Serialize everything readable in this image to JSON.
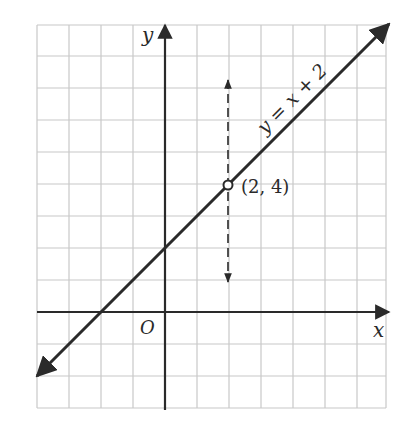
{
  "diagram": {
    "type": "coordinate-graph",
    "grid": {
      "x_min": -4,
      "x_max": 7,
      "y_min": -3,
      "y_max": 9,
      "cell_px": 32,
      "color": "#c8c8c8"
    },
    "axes": {
      "x_label": "x",
      "y_label": "y",
      "origin_label": "O",
      "color": "#2a2a2a"
    },
    "line": {
      "equation_label": "y = x + 2",
      "slope": 1,
      "intercept": 2,
      "color": "#2a2a2a"
    },
    "point": {
      "x": 2,
      "y": 4,
      "label": "(2, 4)"
    },
    "dashed_arrow": {
      "x": 2,
      "y_top": 7.3,
      "y_bottom": 0.9,
      "style": "dashed",
      "double_headed": true
    }
  }
}
